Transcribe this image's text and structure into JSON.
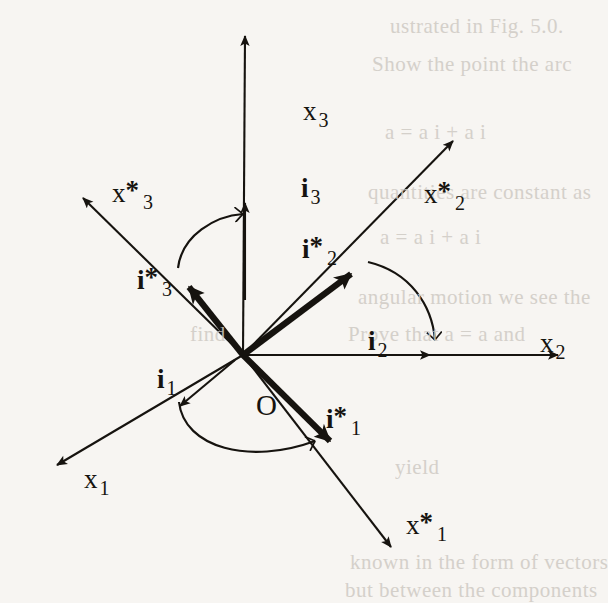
{
  "figure": {
    "type": "vector-diagram",
    "background_color": "#f7f5f2",
    "ink_color": "#16130f",
    "origin": {
      "label": "O",
      "x": 243,
      "y": 355
    },
    "axes": [
      {
        "name": "x1",
        "base": "x",
        "sub": "1",
        "star": false,
        "label_x": 84,
        "label_y": 466,
        "tip_x": 48,
        "tip_y": 467,
        "style": "thin"
      },
      {
        "name": "x2",
        "base": "x",
        "sub": "2",
        "star": false,
        "label_x": 540,
        "label_y": 330,
        "tip_x": 567,
        "tip_y": 355,
        "style": "thin"
      },
      {
        "name": "x3",
        "base": "x",
        "sub": "3",
        "star": false,
        "label_x": 303,
        "label_y": 98,
        "tip_x": 245,
        "tip_y": 28,
        "style": "thin"
      },
      {
        "name": "x*1",
        "base": "x",
        "sub": "1",
        "star": true,
        "label_x": 406,
        "label_y": 512,
        "tip_x": 397,
        "tip_y": 556,
        "style": "thin"
      },
      {
        "name": "x*2",
        "base": "x",
        "sub": "2",
        "star": true,
        "label_x": 424,
        "label_y": 181,
        "tip_x": 461,
        "tip_y": 132,
        "style": "thin"
      },
      {
        "name": "x*3",
        "base": "x",
        "sub": "3",
        "star": true,
        "label_x": 112,
        "label_y": 180,
        "tip_x": 74,
        "tip_y": 192,
        "style": "thin"
      }
    ],
    "unit_vectors": [
      {
        "name": "i1",
        "base": "i",
        "sub": "1",
        "star": false,
        "label_x": 157,
        "label_y": 366,
        "tip_x": 171,
        "tip_y": 411,
        "style": "thin"
      },
      {
        "name": "i2",
        "base": "i",
        "sub": "2",
        "star": false,
        "label_x": 368,
        "label_y": 328,
        "tip_x": 435,
        "tip_y": 355,
        "style": "thin"
      },
      {
        "name": "i3",
        "base": "i",
        "sub": "3",
        "star": false,
        "label_x": 301,
        "label_y": 175,
        "tip_x": 245,
        "tip_y": 198,
        "style": "thin"
      },
      {
        "name": "i*1",
        "base": "i",
        "sub": "1",
        "star": true,
        "label_x": 326,
        "label_y": 406,
        "tip_x": 336,
        "tip_y": 448,
        "style": "bold"
      },
      {
        "name": "i*2",
        "base": "i",
        "sub": "2",
        "star": true,
        "label_x": 302,
        "label_y": 236,
        "tip_x": 358,
        "tip_y": 268,
        "style": "bold"
      },
      {
        "name": "i*3",
        "base": "i",
        "sub": "3",
        "star": true,
        "label_x": 137,
        "label_y": 267,
        "tip_x": 182,
        "tip_y": 281,
        "style": "bold"
      }
    ],
    "angle_arcs": [
      {
        "name": "arc-i3-star-to-i3",
        "from": "i*3",
        "to": "i3"
      },
      {
        "name": "arc-i2-star-to-i2",
        "from": "i*2",
        "to": "i2"
      },
      {
        "name": "arc-i1-to-i1-star",
        "from": "i1",
        "to": "i*1"
      }
    ],
    "bleed_text": [
      {
        "text": "ustrated in Fig. 5.0.",
        "x": 390,
        "y": 14
      },
      {
        "text": "Show the point the arc",
        "x": 372,
        "y": 52
      },
      {
        "text": "a = a i + a i",
        "x": 385,
        "y": 120
      },
      {
        "text": "quantities are constant as",
        "x": 368,
        "y": 180
      },
      {
        "text": "a = a i + a i",
        "x": 380,
        "y": 225
      },
      {
        "text": "angular motion we see the",
        "x": 358,
        "y": 285
      },
      {
        "text": "Prove that a = a and",
        "x": 348,
        "y": 322
      },
      {
        "text": "find",
        "x": 190,
        "y": 322
      },
      {
        "text": "yield",
        "x": 395,
        "y": 455
      },
      {
        "text": "known in the form of vectors",
        "x": 350,
        "y": 550
      },
      {
        "text": "but between the components",
        "x": 345,
        "y": 578
      }
    ]
  }
}
